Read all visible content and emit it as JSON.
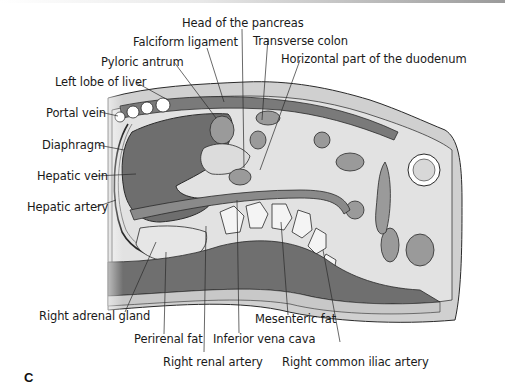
{
  "figure": {
    "panel_letter": "C",
    "labels": {
      "head_of_pancreas": "Head of the pancreas",
      "falciform_ligament": "Falciform ligament",
      "transverse_colon": "Transverse colon",
      "pyloric_antrum": "Pyloric antrum",
      "horizontal_duodenum": "Horizontal part of the duodenum",
      "left_lobe_liver": "Left lobe of liver",
      "portal_vein": "Portal vein",
      "diaphragm": "Diaphragm",
      "hepatic_vein": "Hepatic vein",
      "hepatic_artery": "Hepatic artery",
      "right_adrenal_gland": "Right adrenal gland",
      "perirenal_fat": "Perirenal fat",
      "right_renal_artery": "Right renal artery",
      "inferior_vena_cava": "Inferior vena cava",
      "mesenteric_fat": "Mesenteric fat",
      "right_common_iliac_artery": "Right common iliac artery"
    },
    "colors": {
      "liver": "#6e6e6e",
      "muscle": "#7a7a7a",
      "fat": "#d6d6d6",
      "tissue_light": "#c4c4c4",
      "bone": "#f4f4f4",
      "outline": "#2a2a2a",
      "background": "#ffffff"
    }
  }
}
